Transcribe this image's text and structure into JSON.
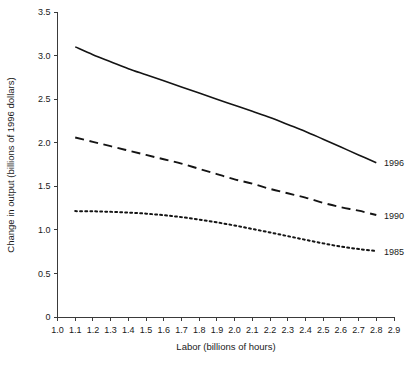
{
  "chart_data": {
    "type": "line",
    "title": "",
    "xlabel": "Labor (billions of hours)",
    "ylabel": "Change in output (billions of 1996 dollars)",
    "xlim": [
      1.0,
      2.9
    ],
    "ylim": [
      0,
      3.5
    ],
    "grid": false,
    "legend_position": "right-of-plot-inline",
    "xticks": [
      "1.0",
      "1.1",
      "1.2",
      "1.3",
      "1.4",
      "1.5",
      "1.6",
      "1.7",
      "1.8",
      "1.9",
      "2.0",
      "2.1",
      "2.2",
      "2.3",
      "2.4",
      "2.5",
      "2.6",
      "2.7",
      "2.8",
      "2.9"
    ],
    "xtick_values": [
      1.0,
      1.1,
      1.2,
      1.3,
      1.4,
      1.5,
      1.6,
      1.7,
      1.8,
      1.9,
      2.0,
      2.1,
      2.2,
      2.3,
      2.4,
      2.5,
      2.6,
      2.7,
      2.8,
      2.9
    ],
    "yticks": [
      "0",
      "0.5",
      "1.0",
      "1.5",
      "2.0",
      "2.5",
      "3.0",
      "3.5"
    ],
    "ytick_values": [
      0,
      0.5,
      1.0,
      1.5,
      2.0,
      2.5,
      3.0,
      3.5
    ],
    "series": [
      {
        "name": "1996",
        "label": "1996",
        "style": "solid",
        "color": "#141414",
        "x": [
          1.1,
          1.2,
          1.3,
          1.4,
          1.5,
          1.6,
          1.7,
          1.8,
          1.9,
          2.0,
          2.1,
          2.2,
          2.3,
          2.4,
          2.5,
          2.6,
          2.7,
          2.8
        ],
        "values": [
          3.1,
          3.01,
          2.93,
          2.85,
          2.78,
          2.71,
          2.64,
          2.57,
          2.5,
          2.43,
          2.36,
          2.29,
          2.21,
          2.13,
          2.04,
          1.95,
          1.86,
          1.77
        ]
      },
      {
        "name": "1990",
        "label": "1990",
        "style": "dashed",
        "color": "#141414",
        "x": [
          1.1,
          1.2,
          1.3,
          1.4,
          1.5,
          1.6,
          1.7,
          1.8,
          1.9,
          2.0,
          2.1,
          2.2,
          2.3,
          2.4,
          2.5,
          2.6,
          2.7,
          2.8
        ],
        "values": [
          2.06,
          2.01,
          1.96,
          1.91,
          1.86,
          1.81,
          1.76,
          1.7,
          1.64,
          1.58,
          1.53,
          1.47,
          1.42,
          1.37,
          1.31,
          1.26,
          1.22,
          1.17
        ]
      },
      {
        "name": "1985",
        "label": "1985",
        "style": "dotted",
        "color": "#141414",
        "x": [
          1.1,
          1.2,
          1.3,
          1.4,
          1.5,
          1.6,
          1.7,
          1.8,
          1.9,
          2.0,
          2.1,
          2.2,
          2.3,
          2.4,
          2.5,
          2.6,
          2.7,
          2.8
        ],
        "values": [
          1.215,
          1.213,
          1.207,
          1.198,
          1.186,
          1.168,
          1.146,
          1.118,
          1.086,
          1.05,
          1.01,
          0.97,
          0.928,
          0.886,
          0.845,
          0.808,
          0.78,
          0.757
        ]
      }
    ]
  }
}
